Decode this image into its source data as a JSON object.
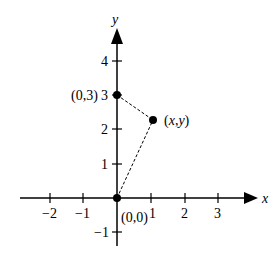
{
  "diagram": {
    "type": "coordinate-plane",
    "axes": {
      "x_label": "x",
      "y_label": "y",
      "x_ticks": [
        "−2",
        "−1",
        "1",
        "2",
        "3"
      ],
      "y_ticks": [
        "4",
        "3",
        "2",
        "1",
        "−1"
      ]
    },
    "points": [
      {
        "label": "(0,3)",
        "x": 0,
        "y": 3
      },
      {
        "label": "(x,y)",
        "x": 1.07,
        "y": 2.27
      },
      {
        "label": "(0,0)",
        "x": 0,
        "y": 0
      }
    ],
    "segments": [
      {
        "from": "(0,3)",
        "to": "(x,y)",
        "style": "dashed"
      },
      {
        "from": "(0,0)",
        "to": "(x,y)",
        "style": "dashed"
      }
    ],
    "labels": {
      "p03": "(0,3)",
      "pxy_open": "(",
      "pxy_x": "x",
      "pxy_comma": ",",
      "pxy_y": "y",
      "pxy_close": ")",
      "p00": "(0,0)"
    }
  }
}
